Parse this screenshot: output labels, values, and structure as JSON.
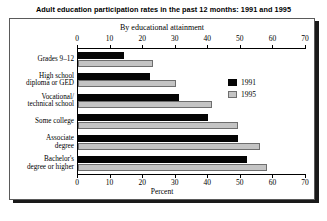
{
  "title": "Adult education participation rates in the past 12 months: 1991 and 1995",
  "subtitle": "By educational attainment",
  "axis_caption": "Percent",
  "legend": {
    "items": [
      {
        "label": "1991",
        "color": "#050505",
        "swatch": "legend-swatch-1991"
      },
      {
        "label": "1995",
        "color": "#c4c4c4",
        "swatch": "legend-swatch-1995"
      }
    ]
  },
  "ticks": [
    "0",
    "10",
    "20",
    "30",
    "40",
    "50",
    "60",
    "70"
  ],
  "chart_data": {
    "type": "bar",
    "orientation": "horizontal",
    "title": "Adult education participation rates in the past 12 months: 1991 and 1995",
    "subtitle": "By educational attainment",
    "xlabel": "Percent",
    "ylabel": "",
    "xlim": [
      0,
      70
    ],
    "xticks": [
      0,
      10,
      20,
      30,
      40,
      50,
      60,
      70
    ],
    "grid": false,
    "legend_position": "inside-right",
    "dual_axis": true,
    "categories": [
      "Grades 9–12",
      "High school diploma or GED",
      "Vocational/ technical school",
      "Some college",
      "Associate degree",
      "Bachelor's degree or higher"
    ],
    "category_lines": [
      [
        "Grades 9–12"
      ],
      [
        "High school",
        "diploma or GED"
      ],
      [
        "Vocational/",
        "technical school"
      ],
      [
        "Some college"
      ],
      [
        "Associate",
        "degree"
      ],
      [
        "Bachelor's",
        "degree or higher"
      ]
    ],
    "series": [
      {
        "name": "1991",
        "color": "#050505",
        "values": [
          14,
          22,
          31,
          40,
          49,
          52
        ]
      },
      {
        "name": "1995",
        "color": "#c4c4c4",
        "values": [
          23,
          30,
          41,
          49,
          56,
          58
        ]
      }
    ]
  }
}
